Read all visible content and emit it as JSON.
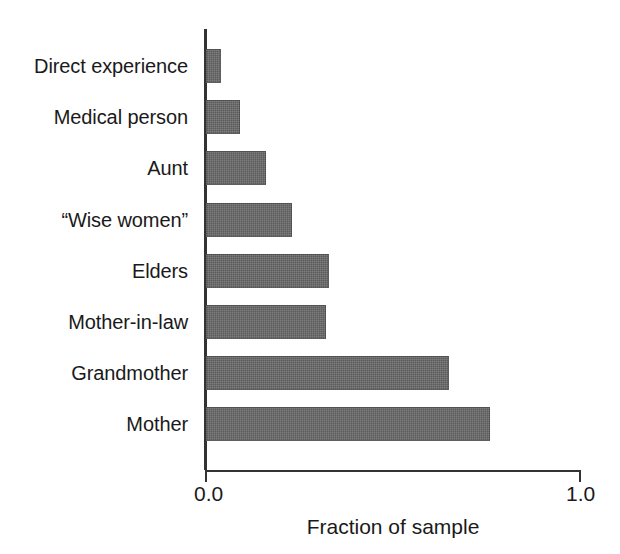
{
  "chart_data": {
    "type": "bar",
    "orientation": "horizontal",
    "title": "",
    "xlabel": "Fraction of sample",
    "ylabel": "",
    "xlim": [
      0.0,
      1.0
    ],
    "xticks": [
      0.0,
      1.0
    ],
    "xtick_labels": [
      "0.0",
      "1.0"
    ],
    "grid": false,
    "legend": null,
    "bar_color": "#5c5c5c",
    "axis_color": "#333333",
    "background_color": "#ffffff",
    "categories": [
      "Direct experience",
      "Medical person",
      "Aunt",
      "“Wise women”",
      "Elders",
      "Mother-in-law",
      "Grandmother",
      "Mother"
    ],
    "values": [
      0.04,
      0.09,
      0.16,
      0.23,
      0.33,
      0.32,
      0.65,
      0.76
    ],
    "bars": [
      {
        "category": "Direct experience",
        "value": 0.04
      },
      {
        "category": "Medical person",
        "value": 0.09
      },
      {
        "category": "Aunt",
        "value": 0.16
      },
      {
        "category": "“Wise women”",
        "value": 0.23
      },
      {
        "category": "Elders",
        "value": 0.33
      },
      {
        "category": "Mother-in-law",
        "value": 0.32
      },
      {
        "category": "Grandmother",
        "value": 0.65
      },
      {
        "category": "Mother",
        "value": 0.76
      }
    ]
  }
}
